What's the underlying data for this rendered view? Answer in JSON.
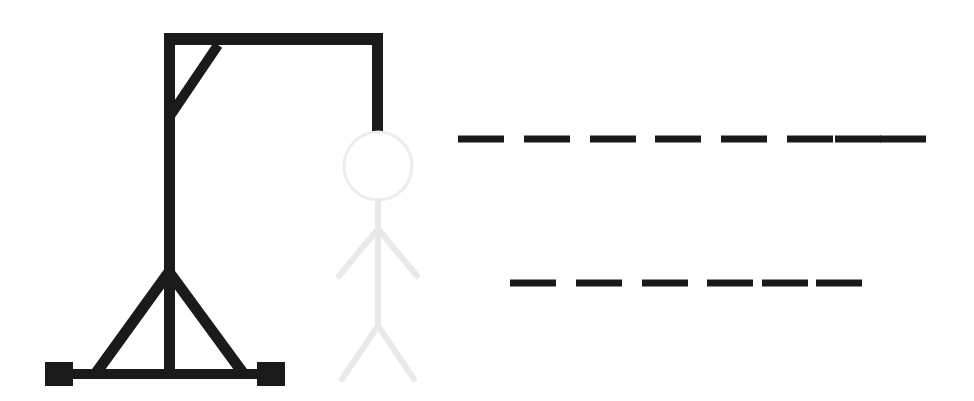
{
  "app": {
    "title": "Hangman",
    "background_color": "#ffffff"
  },
  "colors": {
    "gallows": "#1a1a1a",
    "figure_ghost": "#e9e9e9",
    "blank_line": "#1a1a1a",
    "background": "#ffffff"
  },
  "gallows": {
    "label": "Gallows",
    "stroke_color": "#1a1a1a",
    "stroke_width": 11,
    "parts": [
      {
        "name": "base-bar",
        "label": "Base bar",
        "shape": "rect",
        "x": 58,
        "y": 369,
        "width": 215,
        "height": 10
      },
      {
        "name": "left-foot-block",
        "label": "Left foot block",
        "shape": "rect",
        "x": 45,
        "y": 362,
        "width": 28,
        "height": 24
      },
      {
        "name": "right-foot-block",
        "label": "Right foot block",
        "shape": "rect",
        "x": 257,
        "y": 362,
        "width": 28,
        "height": 24
      },
      {
        "name": "vertical-post",
        "label": "Vertical post",
        "shape": "rect",
        "x": 164,
        "y": 33,
        "width": 11,
        "height": 345
      },
      {
        "name": "top-beam",
        "label": "Top beam",
        "shape": "rect",
        "x": 164,
        "y": 33,
        "width": 219,
        "height": 12
      },
      {
        "name": "rope",
        "label": "Rope",
        "shape": "rect",
        "x": 372,
        "y": 33,
        "width": 11,
        "height": 100
      },
      {
        "name": "corner-brace",
        "label": "Corner diagonal brace",
        "shape": "line",
        "x1": 170,
        "y1": 116,
        "x2": 218,
        "y2": 45
      },
      {
        "name": "left-support-brace",
        "label": "Left support brace",
        "shape": "line",
        "x1": 169,
        "y1": 274,
        "x2": 97,
        "y2": 372
      },
      {
        "name": "right-support-brace",
        "label": "Right support brace",
        "shape": "line",
        "x1": 169,
        "y1": 274,
        "x2": 242,
        "y2": 372
      }
    ]
  },
  "figure": {
    "label": "Hanged man figure",
    "state": "ghost",
    "stroke_color": "#e9e9e9",
    "stroke_width": 6,
    "wrong_guesses": 0,
    "parts": [
      {
        "name": "head",
        "label": "Head",
        "shape": "circle",
        "cx": 378,
        "cy": 166,
        "r": 35
      },
      {
        "name": "torso",
        "label": "Torso",
        "shape": "line",
        "x1": 378,
        "y1": 201,
        "x2": 378,
        "y2": 326
      },
      {
        "name": "left-arm",
        "label": "Left arm",
        "shape": "line",
        "x1": 378,
        "y1": 229,
        "x2": 340,
        "y2": 275
      },
      {
        "name": "right-arm",
        "label": "Right arm",
        "shape": "line",
        "x1": 378,
        "y1": 229,
        "x2": 416,
        "y2": 275
      },
      {
        "name": "left-leg",
        "label": "Left leg",
        "shape": "line",
        "x1": 378,
        "y1": 326,
        "x2": 343,
        "y2": 378
      },
      {
        "name": "right-leg",
        "label": "Right leg",
        "shape": "line",
        "x1": 378,
        "y1": 326,
        "x2": 413,
        "y2": 378
      }
    ]
  },
  "puzzle": {
    "label": "Word blanks",
    "revealed_letters": [],
    "blank_line_color": "#1a1a1a",
    "blank_line_thickness": 7,
    "rows": [
      {
        "name": "word-row-1",
        "label": "Word row 1",
        "letter_count": 8,
        "y": 139,
        "blanks": [
          {
            "index": 1,
            "letter": "",
            "x": 458,
            "width": 46
          },
          {
            "index": 2,
            "letter": "",
            "x": 524,
            "width": 46
          },
          {
            "index": 3,
            "letter": "",
            "x": 590,
            "width": 46
          },
          {
            "index": 4,
            "letter": "",
            "x": 655,
            "width": 46
          },
          {
            "index": 5,
            "letter": "",
            "x": 721,
            "width": 46
          },
          {
            "index": 6,
            "letter": "",
            "x": 787,
            "width": 46
          },
          {
            "index": 7,
            "letter": "",
            "x": 835,
            "width": 46
          },
          {
            "index": 8,
            "letter": "",
            "x": 880,
            "width": 46
          }
        ]
      },
      {
        "name": "word-row-2",
        "label": "Word row 2",
        "letter_count": 6,
        "y": 283,
        "blanks": [
          {
            "index": 1,
            "letter": "",
            "x": 510,
            "width": 46
          },
          {
            "index": 2,
            "letter": "",
            "x": 576,
            "width": 46
          },
          {
            "index": 3,
            "letter": "",
            "x": 642,
            "width": 46
          },
          {
            "index": 4,
            "letter": "",
            "x": 707,
            "width": 46
          },
          {
            "index": 5,
            "letter": "",
            "x": 762,
            "width": 46
          },
          {
            "index": 6,
            "letter": "",
            "x": 816,
            "width": 46
          }
        ]
      }
    ]
  }
}
